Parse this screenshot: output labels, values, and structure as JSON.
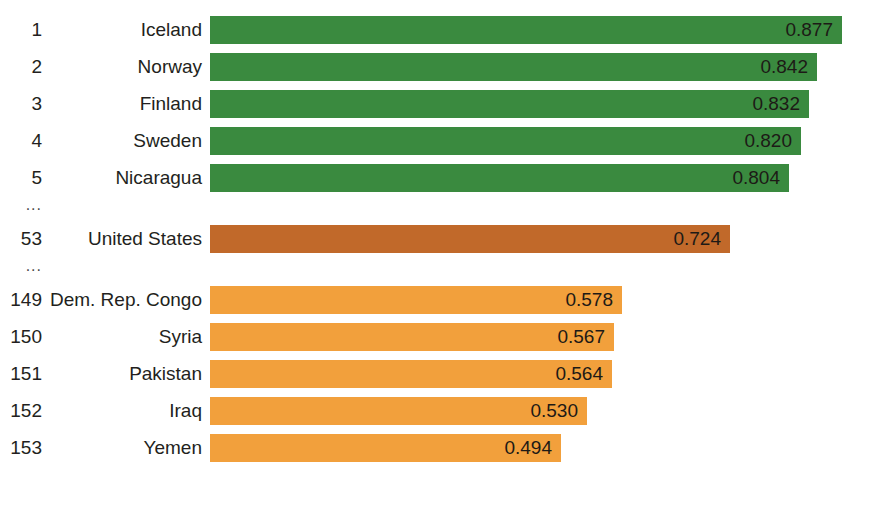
{
  "chart_data": {
    "type": "bar",
    "orientation": "horizontal",
    "title": "",
    "subtitle": "",
    "xlabel": "",
    "ylabel": "",
    "grid": false,
    "legend": "none",
    "value_format": "0.000",
    "xlim": [
      0.0,
      0.9
    ],
    "categories": [
      "Iceland",
      "Norway",
      "Finland",
      "Sweden",
      "Nicaragua",
      "United States",
      "Dem. Rep. Congo",
      "Syria",
      "Pakistan",
      "Iraq",
      "Yemen"
    ],
    "ranks": [
      1,
      2,
      3,
      4,
      5,
      53,
      149,
      150,
      151,
      152,
      153
    ],
    "values": [
      0.877,
      0.842,
      0.832,
      0.82,
      0.804,
      0.724,
      0.578,
      0.567,
      0.564,
      0.53,
      0.494
    ],
    "colors": [
      "#3a8a3f",
      "#3a8a3f",
      "#3a8a3f",
      "#3a8a3f",
      "#3a8a3f",
      "#c1692a",
      "#f2a03c",
      "#f2a03c",
      "#f2a03c",
      "#f2a03c",
      "#f2a03c"
    ],
    "ellipsis_after_index": [
      4,
      5
    ],
    "ellipsis_label": "..."
  },
  "palette": {
    "top_group": "#3a8a3f",
    "highlight_group": "#c1692a",
    "bottom_group": "#f2a03c",
    "background": "#ffffff",
    "text": "#231f20"
  },
  "rows": [
    {
      "rank": "1",
      "country": "Iceland",
      "value": "0.877",
      "value_num": 0.877,
      "color": "#3a8a3f"
    },
    {
      "rank": "2",
      "country": "Norway",
      "value": "0.842",
      "value_num": 0.842,
      "color": "#3a8a3f"
    },
    {
      "rank": "3",
      "country": "Finland",
      "value": "0.832",
      "value_num": 0.832,
      "color": "#3a8a3f"
    },
    {
      "rank": "4",
      "country": "Sweden",
      "value": "0.820",
      "value_num": 0.82,
      "color": "#3a8a3f"
    },
    {
      "rank": "5",
      "country": "Nicaragua",
      "value": "0.804",
      "value_num": 0.804,
      "color": "#3a8a3f"
    },
    {
      "rank": "53",
      "country": "United States",
      "value": "0.724",
      "value_num": 0.724,
      "color": "#c1692a"
    },
    {
      "rank": "149",
      "country": "Dem. Rep. Congo",
      "value": "0.578",
      "value_num": 0.578,
      "color": "#f2a03c"
    },
    {
      "rank": "150",
      "country": "Syria",
      "value": "0.567",
      "value_num": 0.567,
      "color": "#f2a03c"
    },
    {
      "rank": "151",
      "country": "Pakistan",
      "value": "0.564",
      "value_num": 0.564,
      "color": "#f2a03c"
    },
    {
      "rank": "152",
      "country": "Iraq",
      "value": "0.530",
      "value_num": 0.53,
      "color": "#f2a03c"
    },
    {
      "rank": "153",
      "country": "Yemen",
      "value": "0.494",
      "value_num": 0.494,
      "color": "#f2a03c"
    }
  ],
  "separators": [
    {
      "label": "...",
      "after_row_index": 4
    },
    {
      "label": "...",
      "after_row_index": 5
    }
  ]
}
